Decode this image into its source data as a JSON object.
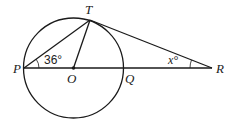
{
  "diagram": {
    "type": "geometry",
    "points": {
      "P": {
        "label": "P",
        "x": 24,
        "y": 68
      },
      "O": {
        "label": "O",
        "x": 73,
        "y": 68
      },
      "Q": {
        "label": "Q",
        "x": 123,
        "y": 68
      },
      "T": {
        "label": "T",
        "x": 90,
        "y": 20
      },
      "R": {
        "label": "R",
        "x": 212,
        "y": 68
      }
    },
    "circle": {
      "center": "O",
      "radius": 50
    },
    "segments": [
      "PR",
      "PT",
      "OT",
      "TR"
    ],
    "angles": {
      "TPO": {
        "label": "36°",
        "vertex": "P"
      },
      "TRP": {
        "label": "x°",
        "vertex": "R"
      }
    },
    "colors": {
      "stroke": "#1a1a1a",
      "background": "#ffffff"
    }
  }
}
